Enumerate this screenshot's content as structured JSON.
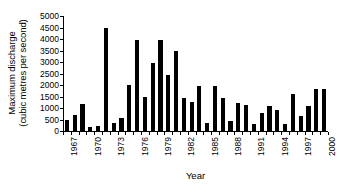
{
  "chart_data": {
    "type": "bar",
    "title": "",
    "xlabel": "Year",
    "ylabel_lines": [
      "Maximum discharge",
      "(cubic metres per second)"
    ],
    "ylabel": "Maximum discharge (cubic metres per second)",
    "ylim": [
      0,
      5000
    ],
    "ytick_step": 500,
    "ytick_labels": [
      "5000",
      "4500",
      "4000",
      "3500",
      "3000",
      "2500",
      "2000",
      "1500",
      "1000",
      "500",
      "0"
    ],
    "ytick_values": [
      5000,
      4500,
      4000,
      3500,
      3000,
      2500,
      2000,
      1500,
      1000,
      500,
      0
    ],
    "xtick_labels": [
      "1967",
      "1970",
      "1973",
      "1976",
      "1979",
      "1982",
      "1985",
      "1988",
      "1991",
      "1994",
      "1997",
      "2000"
    ],
    "xtick_label_step": 3,
    "grid": false,
    "legend": null,
    "bar_color": "#000000",
    "categories": [
      "1967",
      "1968",
      "1969",
      "1970",
      "1971",
      "1972",
      "1973",
      "1974",
      "1975",
      "1976",
      "1977",
      "1978",
      "1979",
      "1980",
      "1981",
      "1982",
      "1983",
      "1984",
      "1985",
      "1986",
      "1987",
      "1988",
      "1989",
      "1990",
      "1991",
      "1992",
      "1993",
      "1994",
      "1995",
      "1996",
      "1997",
      "1998",
      "1999",
      "2000"
    ],
    "values": [
      460,
      690,
      1160,
      170,
      200,
      4480,
      370,
      570,
      1980,
      3960,
      1480,
      2960,
      3950,
      2450,
      3460,
      1450,
      1260,
      1940,
      330,
      1940,
      1430,
      440,
      1230,
      1110,
      310,
      800,
      1090,
      910,
      300,
      1600,
      640,
      1090,
      1810,
      1810
    ]
  }
}
